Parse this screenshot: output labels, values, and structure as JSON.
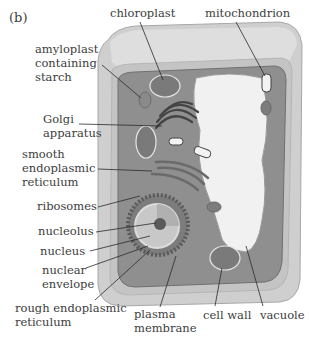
{
  "figure": {
    "panel_label": "(b)"
  },
  "labels": {
    "chloroplast": "chloroplast",
    "mitochondrion": "mitochondrion",
    "amyloplast": [
      "amyloplast",
      "containing",
      "starch"
    ],
    "golgi": [
      "Golgi",
      "apparatus"
    ],
    "smooth_er": [
      "smooth",
      "endoplasmic",
      "reticulum"
    ],
    "ribosomes": "ribosomes",
    "nucleolus": "nucleolus",
    "nucleus": "nucleus",
    "nuclear_envelope": [
      "nuclear",
      "envelope"
    ],
    "rough_er": [
      "rough endoplasmic",
      "reticulum"
    ],
    "plasma_membrane": [
      "plasma",
      "membrane"
    ],
    "cell_wall": "cell wall",
    "vacuole": "vacuole"
  },
  "colors": {
    "cell_wall_outer": "#c9c9c9",
    "cell_wall_top": "#d9d9d9",
    "cytoplasm": "#8e8e8e",
    "vacuole": "#f2f2f2",
    "organelle_dark": "#555555",
    "leader_line": "#2a2a2a"
  }
}
